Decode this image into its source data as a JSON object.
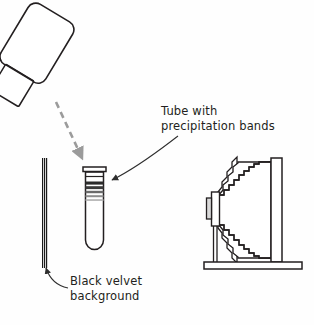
{
  "figure": {
    "background_color": "#fefefe",
    "ink_color": "#231f20",
    "width": 314,
    "height": 325
  },
  "labels": {
    "tube": {
      "line1": "Tube with",
      "line2": "precipitation bands",
      "full": "Tube with\nprecipitation bands"
    },
    "velvet": {
      "line1": "Black velvet",
      "line2": "background",
      "full": "Black velvet\nbackground"
    }
  },
  "objects": {
    "lamp": {
      "name": "uv-lamp",
      "body_label": "",
      "stroke": "#231f20"
    },
    "beam": {
      "name": "light-beam-arrow",
      "style": "dashed",
      "color": "#9b9b9b"
    },
    "velvet_strip": {
      "name": "black-velvet-strip",
      "color": "#1a1a1a",
      "pattern": "hatched"
    },
    "test_tube": {
      "name": "test-tube",
      "band_count": 5,
      "bands": [
        {
          "shade": "#2b2b2b"
        },
        {
          "shade": "#3a3a3a"
        },
        {
          "shade": "#6b6b6b"
        },
        {
          "shade": "#8e8e8e"
        },
        {
          "shade": "#b4b4b4"
        }
      ]
    },
    "viewer": {
      "name": "bellows-viewer",
      "parts": [
        "eyepiece",
        "bellows",
        "screen-panel",
        "stand-post",
        "base-rail"
      ],
      "stroke": "#231f20"
    }
  },
  "pointers": {
    "tube_pointer": {
      "name": "tube-callout-arrow",
      "color": "#3a3a3a"
    },
    "velvet_pointer": {
      "name": "velvet-callout-arrow",
      "color": "#3a3a3a"
    }
  }
}
